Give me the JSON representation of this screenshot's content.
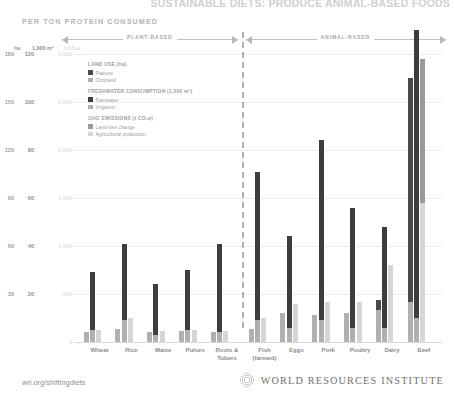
{
  "header": {
    "main_title": "SUSTAINABLE DIETS:  PRODUCE ANIMAL-BASED FOODS",
    "subtitle": "PER TON PROTEIN CONSUMED"
  },
  "group_arrows": [
    {
      "label": "PLANT-BASED"
    },
    {
      "label": "ANIMAL-BASED"
    }
  ],
  "axis_units": {
    "land": "ha",
    "water": "1,000 m³",
    "ghg": "t CO₂e"
  },
  "legend": [
    {
      "title": "LAND USE (ha)",
      "items": [
        {
          "label": "Pasture",
          "color": "#4a4a4a"
        },
        {
          "label": "Cropland",
          "color": "#b0b0b0"
        }
      ]
    },
    {
      "title": "FRESHWATER CONSUMPTION (1,000 m³)",
      "items": [
        {
          "label": "Rainwater",
          "color": "#3d3d3d"
        },
        {
          "label": "Irrigation",
          "color": "#b0b0b0"
        }
      ]
    },
    {
      "title": "GHG EMISSIONS (t CO₂e)",
      "items": [
        {
          "label": "Land-use change",
          "color": "#9a9a9a"
        },
        {
          "label": "Agricultural production",
          "color": "#d6d6d6"
        }
      ]
    }
  ],
  "footer": {
    "url": "wri.org/shiftingdiets",
    "org": "WORLD RESOURCES INSTITUTE"
  },
  "chart_data": {
    "type": "bar",
    "title": "SUSTAINABLE DIETS:  PRODUCE ANIMAL-BASED FOODS",
    "subtitle": "PER TON PROTEIN CONSUMED",
    "xlabel": "",
    "ylabel": "",
    "grid": true,
    "legend_position": "inside-top-left",
    "divider_after_category": "Roots & Tubers",
    "categories": [
      "Wheat",
      "Rice",
      "Maize",
      "Pulses",
      "Roots &\nTubers",
      "Fish\n(farmed)",
      "Eggs",
      "Pork",
      "Poultry",
      "Dairy",
      "Beef"
    ],
    "category_groups": [
      {
        "name": "PLANT-BASED",
        "members": [
          "Wheat",
          "Rice",
          "Maize",
          "Pulses",
          "Roots &\nTubers"
        ]
      },
      {
        "name": "ANIMAL-BASED",
        "members": [
          "Fish\n(farmed)",
          "Eggs",
          "Pork",
          "Poultry",
          "Dairy",
          "Beef"
        ]
      }
    ],
    "axes": [
      {
        "name": "Land use",
        "unit": "ha",
        "ticks": [
          0,
          30,
          60,
          90,
          120,
          150,
          180
        ],
        "ylim": [
          0,
          180
        ]
      },
      {
        "name": "Freshwater consumption",
        "unit": "1,000 m³",
        "ticks": [
          0,
          20,
          40,
          60,
          80,
          100,
          120
        ],
        "ylim": [
          0,
          120
        ]
      },
      {
        "name": "GHG emissions",
        "unit": "t CO₂e",
        "ticks": [
          0,
          500,
          1000,
          1500,
          2000,
          2500,
          3000
        ],
        "ylim": [
          0,
          3000
        ]
      }
    ],
    "series": [
      {
        "name": "Land use – Pasture",
        "axis": "Land use",
        "unit": "ha",
        "color": "#4a4a4a",
        "values": [
          0,
          0,
          0,
          0,
          0,
          0,
          0,
          0,
          0,
          6,
          140
        ]
      },
      {
        "name": "Land use – Cropland",
        "axis": "Land use",
        "unit": "ha",
        "color": "#b0b0b0",
        "values": [
          6,
          8,
          6,
          7,
          6,
          8,
          18,
          17,
          18,
          20,
          25
        ]
      },
      {
        "name": "Freshwater – Rainwater",
        "axis": "Freshwater consumption",
        "unit": "1,000 m³",
        "color": "#3d3d3d",
        "values": [
          24,
          32,
          21,
          25,
          37,
          62,
          38,
          75,
          50,
          42,
          120
        ]
      },
      {
        "name": "Freshwater – Irrigation",
        "axis": "Freshwater consumption",
        "unit": "1,000 m³",
        "color": "#b0b0b0",
        "values": [
          5,
          9,
          3,
          5,
          4,
          9,
          6,
          9,
          6,
          6,
          10
        ]
      },
      {
        "name": "GHG – Land-use change",
        "axis": "GHG emissions",
        "unit": "t CO₂e",
        "color": "#9a9a9a",
        "values": [
          0,
          0,
          0,
          0,
          0,
          0,
          0,
          0,
          0,
          0,
          1500
        ]
      },
      {
        "name": "GHG – Agricultural production",
        "axis": "GHG emissions",
        "unit": "t CO₂e",
        "color": "#d6d6d6",
        "values": [
          120,
          250,
          110,
          130,
          110,
          250,
          400,
          420,
          420,
          800,
          1450
        ]
      }
    ]
  }
}
